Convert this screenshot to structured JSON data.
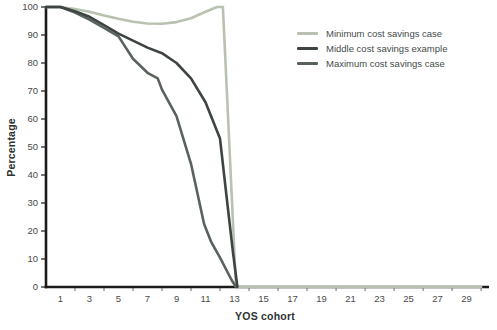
{
  "figure": {
    "background": "#ffffff"
  },
  "chart_data": {
    "type": "line",
    "title": "",
    "xlabel": "YOS cohort",
    "ylabel": "Percentage",
    "xlim": [
      0,
      30.2
    ],
    "ylim": [
      0,
      100
    ],
    "grid": false,
    "legend_position": "top-right-inside",
    "axis_color": "#1b1b1b",
    "tick_label_color": "#4a4a4a",
    "xtick_labels": [
      1,
      3,
      5,
      7,
      9,
      11,
      13,
      15,
      17,
      19,
      21,
      23,
      25,
      27,
      29
    ],
    "xtick_marks": [
      2,
      4,
      6,
      8,
      10,
      12,
      14,
      16,
      18,
      20,
      22,
      24,
      26,
      28,
      30
    ],
    "yticks": [
      0,
      10,
      20,
      30,
      40,
      50,
      60,
      70,
      80,
      90,
      100
    ],
    "series": [
      {
        "name": "Minimum cost savings case",
        "color": "#b9c2b0",
        "line_width": 2.6,
        "points": [
          [
            1,
            100
          ],
          [
            2,
            99.3
          ],
          [
            3,
            98.3
          ],
          [
            4,
            97
          ],
          [
            5,
            95.8
          ],
          [
            6,
            94.7
          ],
          [
            7,
            94.1
          ],
          [
            8,
            94
          ],
          [
            9,
            94.6
          ],
          [
            10,
            96
          ],
          [
            11,
            98.3
          ],
          [
            11.8,
            100
          ],
          [
            12.2,
            100
          ],
          [
            13.1,
            0
          ],
          [
            30,
            0
          ]
        ]
      },
      {
        "name": "Middle cost savings example",
        "color": "#3e4443",
        "line_width": 2.6,
        "points": [
          [
            1,
            100
          ],
          [
            2,
            98.5
          ],
          [
            3,
            96.5
          ],
          [
            4,
            93.5
          ],
          [
            5,
            90.5
          ],
          [
            6,
            88
          ],
          [
            7,
            85.5
          ],
          [
            8,
            83.5
          ],
          [
            9,
            80
          ],
          [
            10,
            74.5
          ],
          [
            11,
            66
          ],
          [
            12,
            53
          ],
          [
            12.5,
            30
          ],
          [
            12.9,
            12
          ],
          [
            13.2,
            0
          ]
        ]
      },
      {
        "name": "Maximum cost savings case",
        "color": "#59635c",
        "line_width": 2.6,
        "points": [
          [
            1,
            100
          ],
          [
            2,
            98
          ],
          [
            3,
            95.5
          ],
          [
            4,
            92.5
          ],
          [
            5,
            89.5
          ],
          [
            6,
            81.5
          ],
          [
            7,
            76.5
          ],
          [
            7.7,
            74.5
          ],
          [
            8,
            70.5
          ],
          [
            9,
            61
          ],
          [
            10,
            44
          ],
          [
            10.9,
            22.5
          ],
          [
            11.4,
            16
          ],
          [
            12,
            10.5
          ],
          [
            12.8,
            2.5
          ],
          [
            13.1,
            0
          ]
        ]
      }
    ]
  }
}
